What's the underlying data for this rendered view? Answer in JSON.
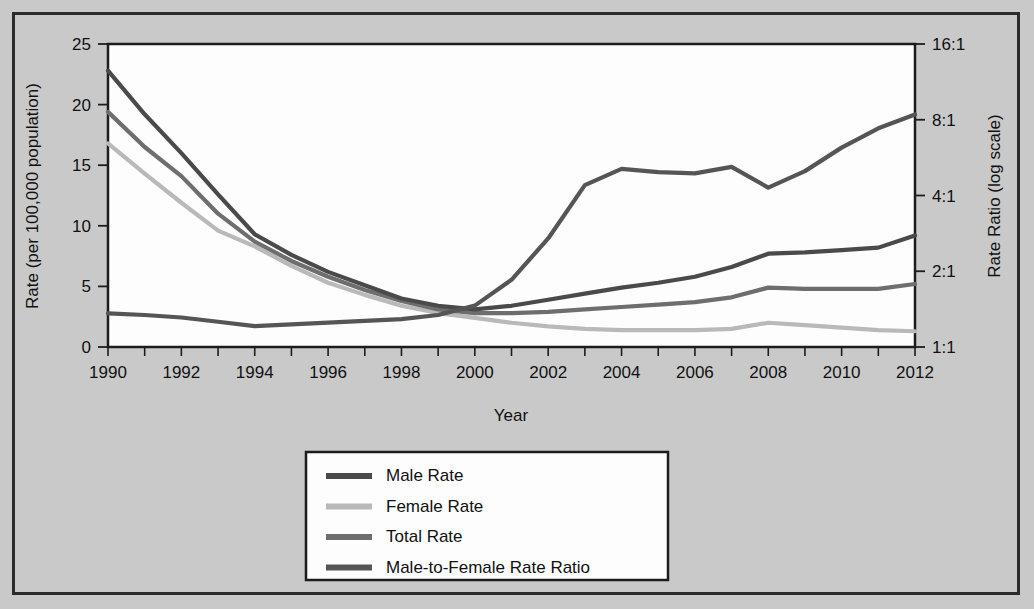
{
  "chart_data": {
    "type": "line",
    "title": "",
    "xlabel": "Year",
    "ylabel": "Rate (per 100,000 population)",
    "y2label": "Rate Ratio (log scale)",
    "grid": false,
    "legend_position": "bottom-center",
    "x": [
      1990,
      1991,
      1992,
      1993,
      1994,
      1995,
      1996,
      1997,
      1998,
      1999,
      2000,
      2001,
      2002,
      2003,
      2004,
      2005,
      2006,
      2007,
      2008,
      2009,
      2010,
      2011,
      2012
    ],
    "xticks": [
      "1990",
      "1992",
      "1994",
      "1996",
      "1998",
      "2000",
      "2002",
      "2004",
      "2006",
      "2008",
      "2010",
      "2012"
    ],
    "xtick_values": [
      1990,
      1992,
      1994,
      1996,
      1998,
      2000,
      2002,
      2004,
      2006,
      2008,
      2010,
      2012
    ],
    "xlim": [
      1990,
      2012
    ],
    "yticks_left": [
      "0",
      "5",
      "10",
      "15",
      "20",
      "25"
    ],
    "ytick_values_left": [
      0,
      5,
      10,
      15,
      20,
      25
    ],
    "ylim": [
      0,
      25
    ],
    "yticks_right": [
      "1:1",
      "2:1",
      "4:1",
      "8:1",
      "16:1"
    ],
    "ytick_values_right": [
      1,
      2,
      4,
      8,
      16
    ],
    "y2lim": [
      1,
      16
    ],
    "y2_scale": "log2",
    "series": [
      {
        "name": "Male Rate",
        "axis": "left",
        "color": "#4a4a4a",
        "values": [
          22.8,
          19.2,
          16.0,
          12.6,
          9.3,
          7.6,
          6.2,
          5.1,
          4.0,
          3.4,
          3.1,
          3.4,
          3.9,
          4.4,
          4.9,
          5.3,
          5.8,
          6.6,
          7.7,
          7.8,
          8.0,
          8.2,
          9.2
        ]
      },
      {
        "name": "Female Rate",
        "axis": "left",
        "color": "#b9b9b9",
        "values": [
          16.8,
          14.3,
          11.9,
          9.6,
          8.3,
          6.7,
          5.3,
          4.3,
          3.4,
          2.8,
          2.4,
          2.0,
          1.7,
          1.5,
          1.4,
          1.4,
          1.4,
          1.5,
          2.0,
          1.8,
          1.6,
          1.4,
          1.3
        ]
      },
      {
        "name": "Total Rate",
        "axis": "left",
        "color": "#6e6e6e",
        "values": [
          19.4,
          16.5,
          14.1,
          11.0,
          8.7,
          7.1,
          5.8,
          4.7,
          3.8,
          3.1,
          2.8,
          2.8,
          2.9,
          3.1,
          3.3,
          3.5,
          3.7,
          4.1,
          4.9,
          4.8,
          4.8,
          4.8,
          5.2
        ]
      },
      {
        "name": "Male-to-Female Rate Ratio",
        "axis": "right",
        "color": "#555555",
        "values": [
          1.36,
          1.34,
          1.31,
          1.26,
          1.21,
          1.23,
          1.25,
          1.27,
          1.29,
          1.34,
          1.46,
          1.85,
          2.7,
          4.4,
          5.1,
          4.95,
          4.9,
          5.2,
          4.3,
          5.0,
          6.2,
          7.4,
          8.4
        ]
      }
    ]
  },
  "legend": {
    "items": [
      {
        "label": "Male Rate",
        "color": "#4a4a4a"
      },
      {
        "label": "Female Rate",
        "color": "#b9b9b9"
      },
      {
        "label": "Total Rate",
        "color": "#6e6e6e"
      },
      {
        "label": "Male-to-Female Rate Ratio",
        "color": "#555555"
      }
    ]
  },
  "colors": {
    "background": "#c9c9c9",
    "plot_background": "#fdfdfd",
    "frame": "#2b2b2b",
    "axis": "#1c1c1c",
    "text": "#111111"
  }
}
